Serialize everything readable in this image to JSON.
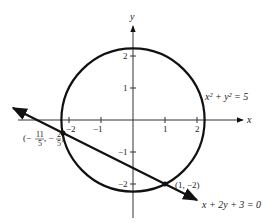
{
  "figure": {
    "type": "diagram",
    "axes": {
      "x_label": "x",
      "y_label": "y",
      "x_ticks": [
        {
          "value": -2,
          "label": "−2"
        },
        {
          "value": -1,
          "label": "−1"
        },
        {
          "value": 1,
          "label": "1"
        },
        {
          "value": 2,
          "label": "2"
        }
      ],
      "y_ticks": [
        {
          "value": 2,
          "label": "2"
        },
        {
          "value": 1,
          "label": "1"
        },
        {
          "value": -1,
          "label": "−1"
        },
        {
          "value": -2,
          "label": "−2"
        }
      ]
    },
    "circle": {
      "equation_label": "x² + y² = 5",
      "center": [
        0,
        0
      ],
      "radius_squared": 5
    },
    "line": {
      "equation_label": "x + 2y + 3 = 0"
    },
    "intersections": [
      {
        "label": "(1, −2)",
        "x": 1,
        "y": -2
      },
      {
        "label_prefix": "(−",
        "label_x_num": "11",
        "label_x_den": "5",
        "label_sep": ", −",
        "label_y_num": "2",
        "label_y_den": "5",
        "label_suffix": ")",
        "x": -2.2,
        "y": -0.4
      }
    ],
    "colors": {
      "stroke": "#111111",
      "text": "#222222",
      "background": "#ffffff"
    }
  }
}
